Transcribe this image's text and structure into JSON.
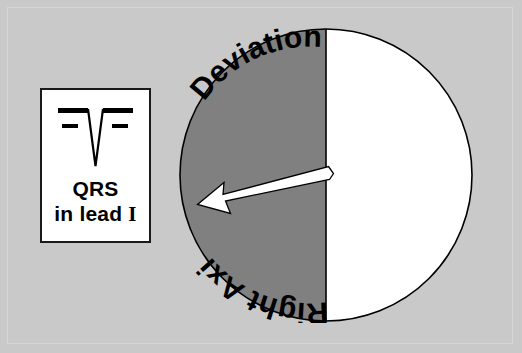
{
  "figure": {
    "background_color": "#c9c9c9",
    "frame_color": "#d6d6d6"
  },
  "qrs_panel": {
    "name": "QRS complex in lead I",
    "title": "QRS",
    "subtitle": "in lead I",
    "subtitle_word": "in lead",
    "lead_numeral": "I",
    "box_fill": "#ffffff",
    "box_border_color": "#1a1a1a",
    "waveform": {
      "description": "predominantly negative QRS complex with deep S wave",
      "baseline_color": "#000000",
      "deflection": "negative"
    }
  },
  "axis_wheel": {
    "name": "cardiac axis circle",
    "center": {
      "x": 148,
      "y": 148
    },
    "radius": 146,
    "shaded_half": {
      "label_line_1": "Deviation",
      "label_line_2": "Right Axis",
      "fill": "#808080",
      "side": "left"
    },
    "normal_half": {
      "fill": "#ffffff",
      "side": "right"
    },
    "outline_color": "#000000",
    "divider_color": "#000000",
    "arrow": {
      "label": "mean QRS axis vector",
      "fill": "#ffffff",
      "outline": "#000000",
      "from": {
        "x": 148,
        "y": 146
      },
      "to": {
        "x": 22,
        "y": 178
      },
      "direction": "down-left"
    }
  }
}
